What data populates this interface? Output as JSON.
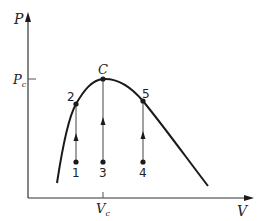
{
  "diagram": {
    "type": "P-V phase diagram",
    "axes": {
      "y_label": "P",
      "x_label": "V",
      "y_tick_label": "P",
      "y_tick_sub": "c",
      "x_tick_label": "V",
      "x_tick_sub": "c"
    },
    "critical_point": {
      "label": "C"
    },
    "points": [
      {
        "id": "1",
        "label": "1"
      },
      {
        "id": "2",
        "label": "2"
      },
      {
        "id": "3",
        "label": "3"
      },
      {
        "id": "4",
        "label": "4"
      },
      {
        "id": "5",
        "label": "5"
      }
    ],
    "colors": {
      "ink": "#1a1a1a",
      "thin_line": "#444444"
    }
  }
}
